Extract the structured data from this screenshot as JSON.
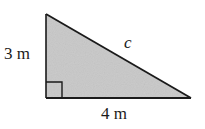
{
  "diagram": {
    "type": "right-triangle",
    "fill_color": "#c8c8c8",
    "stroke_color": "#1a1a1a",
    "vertices": {
      "top": [
        46,
        14
      ],
      "right_angle": [
        46,
        98
      ],
      "right": [
        191,
        98
      ]
    },
    "labels": {
      "vertical_side": "3 m",
      "horizontal_side": "4 m",
      "hypotenuse": "c"
    },
    "right_angle_marker": true
  }
}
